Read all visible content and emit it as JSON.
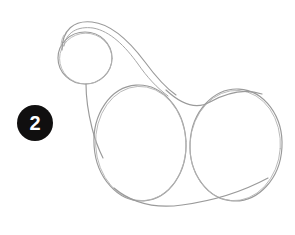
{
  "page": {
    "kind": "drawing-tutorial-step",
    "background_color": "#ffffff",
    "width": 295,
    "height": 235
  },
  "badge": {
    "number": "2",
    "background_color": "#100f0f",
    "text_color": "#ffffff",
    "shape": "circle",
    "diameter_px": 36,
    "position": {
      "x": 17,
      "y": 105
    }
  },
  "sketch": {
    "title": "Step 2 construction sketch",
    "description": "Light pencil guide shapes: a head circle, an arcing mane/neck line, a chest line, and two large overlapping body ovals joined by a belly line.",
    "stroke_color": "#9a9a9a",
    "stroke_width": 1.15,
    "shapes": [
      {
        "name": "head-circle",
        "type": "ellipse",
        "cx": 85,
        "cy": 58,
        "rx": 27,
        "ry": 26
      },
      {
        "name": "mane-arc",
        "type": "path",
        "d": "M 62 50 C 62 30, 74 20, 92 22 C 112 24, 130 42, 145 62 C 156 77, 166 88, 176 95"
      },
      {
        "name": "mane-inner-arc",
        "type": "path",
        "d": "M 64 46 C 66 32, 78 26, 93 28 C 110 31, 125 46, 138 64 C 147 77, 157 88, 168 96"
      },
      {
        "name": "chest-line",
        "type": "path",
        "d": "M 86 84 C 86 96, 88 112, 92 128 C 95 140, 99 150, 103 158"
      },
      {
        "name": "body-oval-front",
        "type": "ellipse",
        "cx": 140,
        "cy": 143,
        "rx": 46,
        "ry": 58,
        "rotation": -4
      },
      {
        "name": "body-oval-rear",
        "type": "ellipse",
        "cx": 236,
        "cy": 145,
        "rx": 46,
        "ry": 56,
        "rotation": 3
      },
      {
        "name": "back-line",
        "type": "path",
        "d": "M 166 90 C 182 105, 196 110, 210 102 C 226 93, 244 88, 262 94"
      },
      {
        "name": "belly-line",
        "type": "path",
        "d": "M 114 188 C 132 203, 154 209, 182 205 C 212 201, 242 192, 268 178"
      }
    ]
  }
}
